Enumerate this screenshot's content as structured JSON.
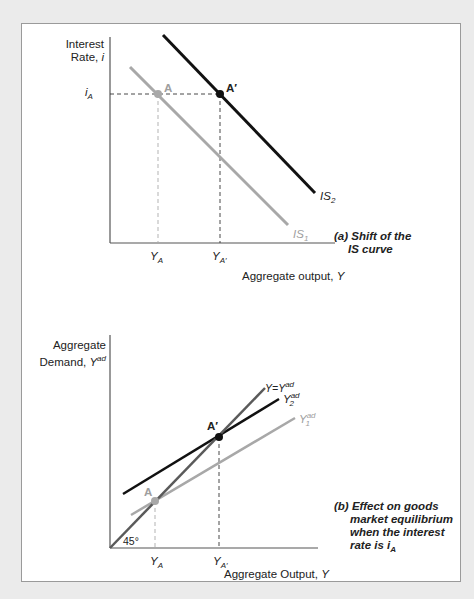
{
  "panel_a": {
    "y_axis_label_line1": "Interest",
    "y_axis_label_line2": "Rate, ",
    "y_axis_var": "i",
    "x_axis_label": "Aggregate output, ",
    "x_axis_var": "Y",
    "tick_y": "i",
    "tick_y_sub": "A",
    "tick_x1": "Y",
    "tick_x1_sub": "A",
    "tick_x2": "Y",
    "tick_x2_sub": "A′",
    "point_a": "A",
    "point_a_prime": "A′",
    "curve1": "IS",
    "curve1_sub": "1",
    "curve2": "IS",
    "curve2_sub": "2",
    "caption_line1": "(a) Shift of the",
    "caption_line2": "IS curve"
  },
  "panel_b": {
    "y_axis_label_line1": "Aggregate",
    "y_axis_label_line2": "Demand, ",
    "y_axis_var": "Y",
    "y_axis_sup": "ad",
    "x_axis_label": "Aggregate Output, ",
    "x_axis_var": "Y",
    "tick_x1": "Y",
    "tick_x1_sub": "A",
    "tick_x2": "Y",
    "tick_x2_sub": "A′",
    "angle_label": "45°",
    "point_a": "A",
    "point_a_prime": "A′",
    "line_45": "Y=Y",
    "line_45_sup": "ad",
    "curve1": "Y",
    "curve1_sup": "ad",
    "curve1_sub": "1",
    "curve2": "Y",
    "curve2_sup": "ad",
    "curve2_sub": "2",
    "caption_line1": "(b) Effect on goods",
    "caption_line2": "market equilibrium",
    "caption_line3": "when the interest",
    "caption_line4": "rate is i",
    "caption_sub": "A"
  },
  "colors": {
    "background": "#ebebeb",
    "frame_border": "#9a9a9a",
    "dark_curve": "#111111",
    "light_curve": "#a8a8a8",
    "mid_curve": "#5a5a5a",
    "axis": "#444444"
  }
}
